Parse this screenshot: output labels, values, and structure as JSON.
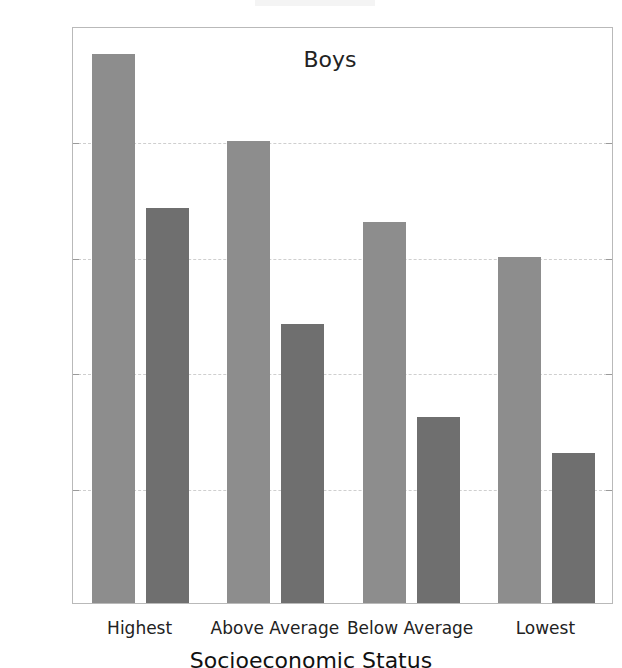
{
  "chart_data": {
    "type": "bar",
    "title": "",
    "annotation": "Boys",
    "xlabel": "Socioeconomic Status",
    "ylabel": "Mean IQ",
    "categories": [
      "Highest",
      "Above Average",
      "Below Average",
      "Lowest"
    ],
    "series": [
      {
        "name": "series-1",
        "color": "#8d8d8d",
        "values": [
          117.6,
          110.0,
          103.0,
          100.0
        ]
      },
      {
        "name": "series-2",
        "color": "#6f6f6f",
        "values": [
          104.2,
          94.2,
          86.1,
          83.0
        ]
      }
    ],
    "ylim": [
      70,
      120
    ],
    "yticks": [
      70,
      80,
      90,
      100,
      110,
      120
    ],
    "ytick_labels": [
      "70",
      "80",
      "90",
      "100",
      "110",
      "120"
    ],
    "grid": true,
    "grid_style": "dashed",
    "legend": "none",
    "legend_position": "none",
    "background_color": "#ffffff",
    "axis_color": "#b9b9b9"
  }
}
